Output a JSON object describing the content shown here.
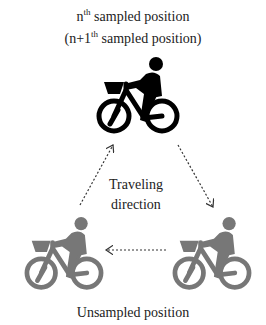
{
  "top_label": {
    "line1_base": "n",
    "line1_sup": "th",
    "line1_rest": " sampled position",
    "line2_open": "(n+1",
    "line2_sup": "th",
    "line2_rest": " sampled position)"
  },
  "center_label": {
    "line1": "Traveling",
    "line2": "direction"
  },
  "bottom_label": "Unsampled position",
  "nodes": [
    {
      "id": "sampled",
      "color": "#000000",
      "position": "top-center"
    },
    {
      "id": "unsampled-left",
      "color": "#777777",
      "position": "bottom-left"
    },
    {
      "id": "unsampled-right",
      "color": "#777777",
      "position": "bottom-right"
    }
  ],
  "arrows": [
    {
      "from": "unsampled-left",
      "to": "sampled",
      "style": "dotted"
    },
    {
      "from": "sampled",
      "to": "unsampled-right",
      "style": "dotted"
    },
    {
      "from": "unsampled-right",
      "to": "unsampled-left",
      "style": "dotted"
    }
  ],
  "colors": {
    "sampled": "#000000",
    "unsampled": "#777777",
    "arrow": "#333333"
  }
}
